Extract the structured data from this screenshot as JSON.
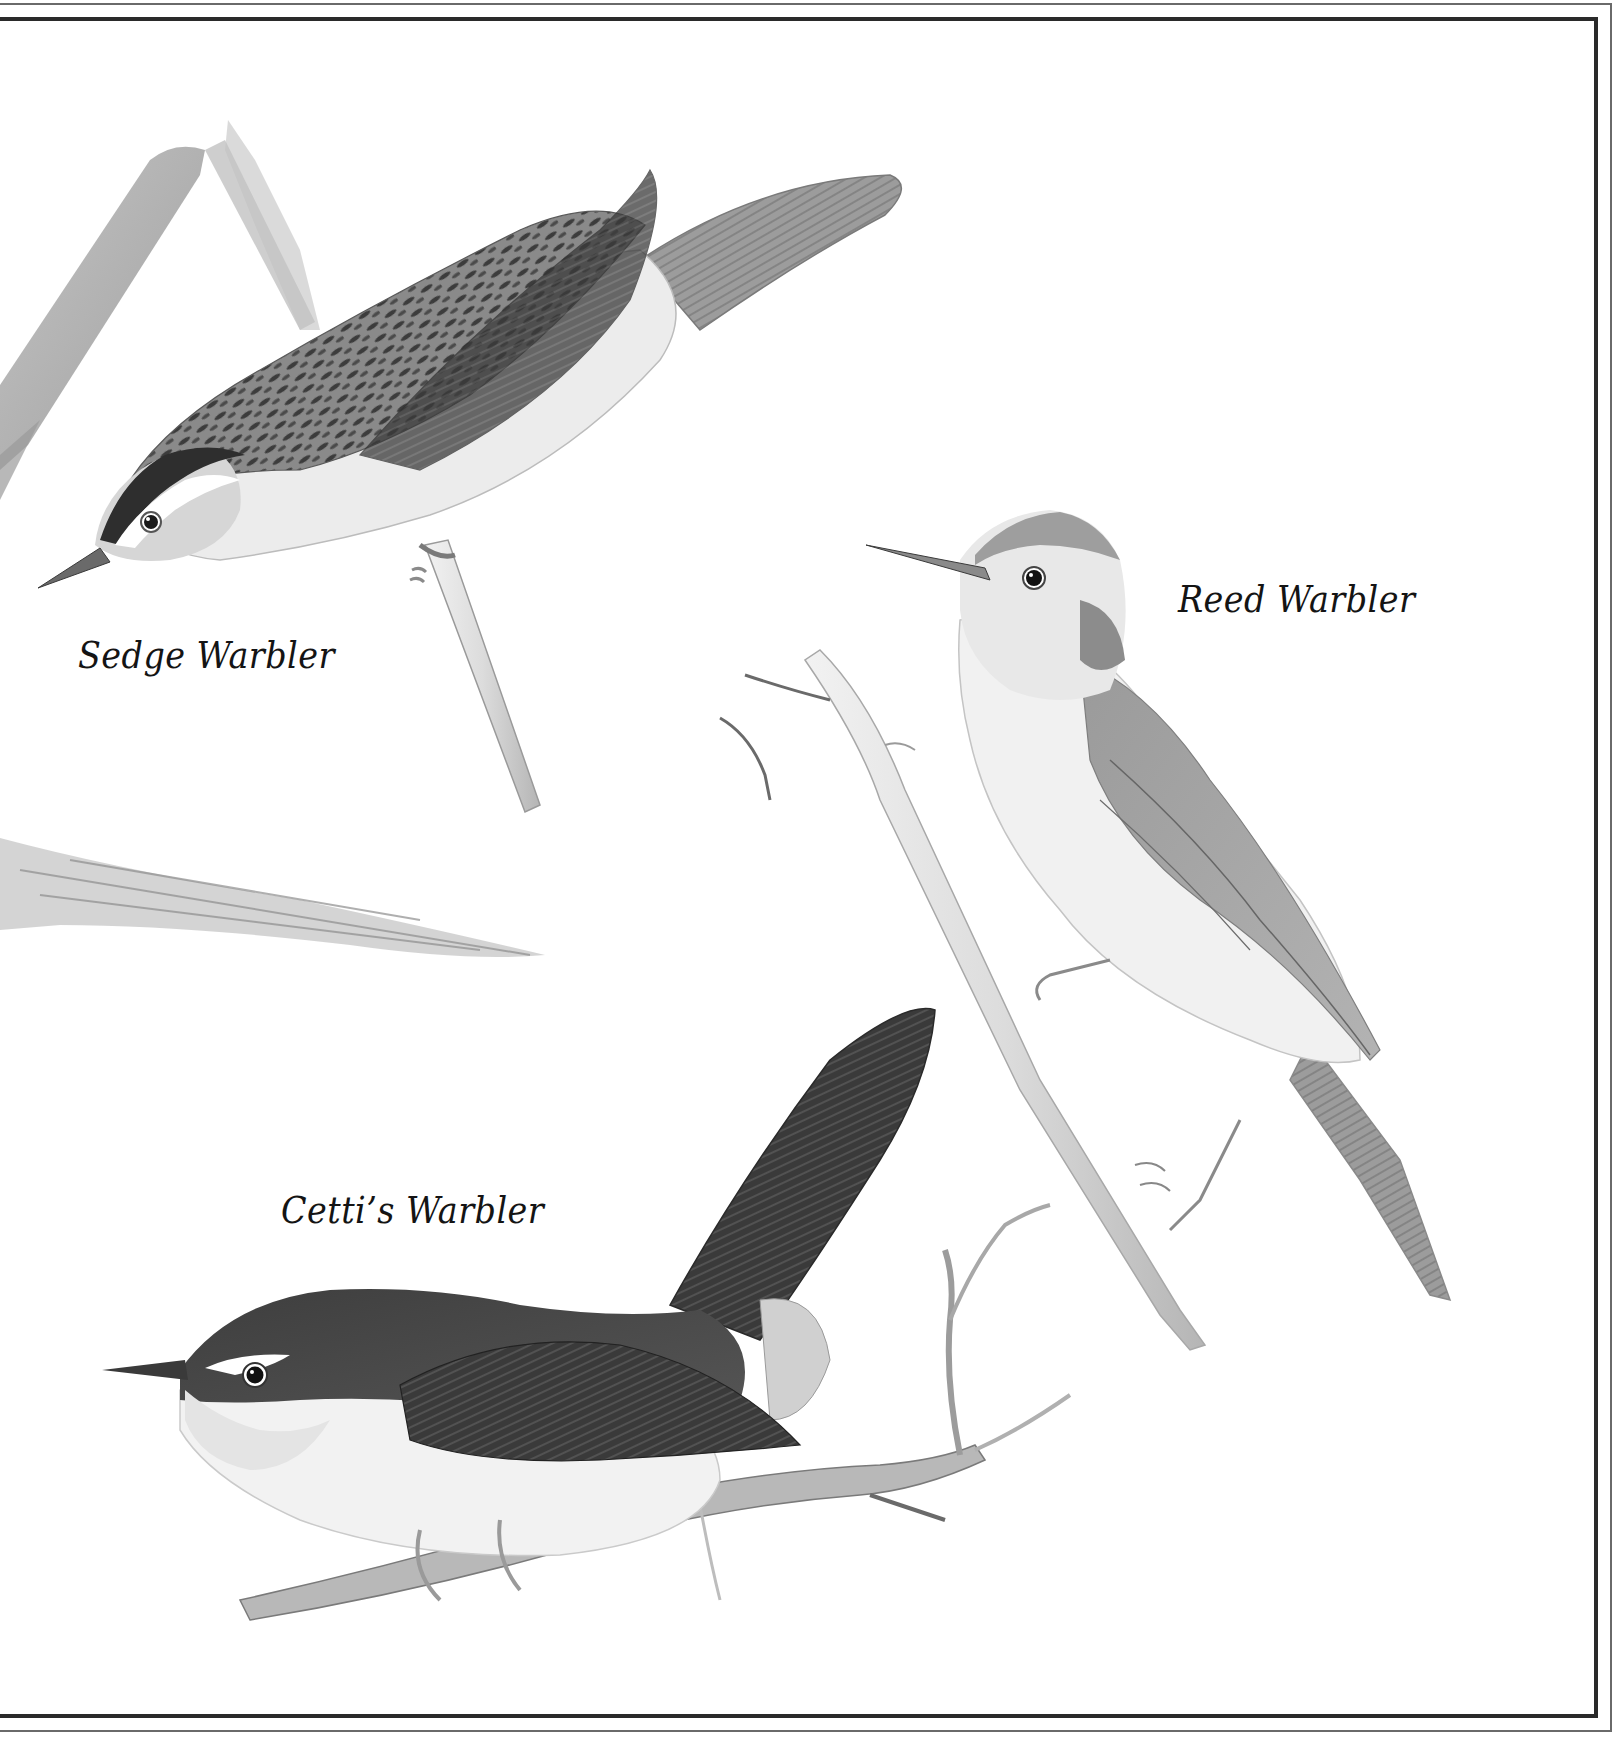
{
  "plate": {
    "captions": {
      "sedge": "Sedge Warbler",
      "reed": "Reed Warbler",
      "cetti": "Cetti’s Warbler"
    },
    "colors": {
      "paper": "#ffffff",
      "frame_inner": "#2a2a2a",
      "frame_outer": "#6a6a6a",
      "ink_dark": "#2b2b2b",
      "graphite_mid": "#8a8a8a",
      "graphite_light": "#c8c8c8"
    },
    "subjects": [
      {
        "name": "Sedge Warbler",
        "pose": "perched head-down on reed stem"
      },
      {
        "name": "Reed Warbler",
        "pose": "perched upright on reed stem, facing left"
      },
      {
        "name": "Cetti’s Warbler",
        "pose": "perched on twig, tail cocked, facing left"
      }
    ]
  }
}
